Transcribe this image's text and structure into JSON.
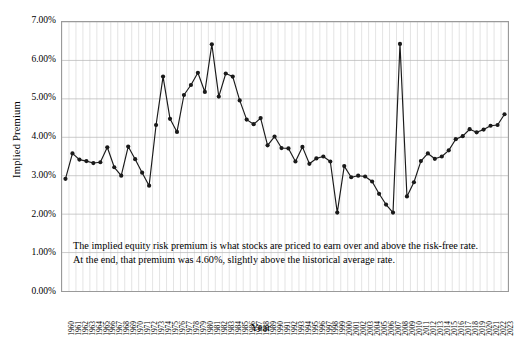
{
  "chart_data": {
    "type": "line",
    "title": "",
    "xlabel": "Year",
    "ylabel": "Implied Premium",
    "ylim": [
      0,
      7
    ],
    "ytick_labels": [
      "7.00%",
      "6.00%",
      "5.00%",
      "4.00%",
      "3.00%",
      "2.00%",
      "1.00%",
      "0.00%"
    ],
    "ytick_values": [
      7,
      6,
      5,
      4,
      3,
      2,
      1,
      0
    ],
    "grid": true,
    "legend": "none",
    "marker": "filled-circle",
    "line_color": "#1a1a1a",
    "grid_color": "#c8c8c8",
    "categories": [
      "1960",
      "1961",
      "1962",
      "1963",
      "1964",
      "1965",
      "1966",
      "1967",
      "1968",
      "1969",
      "1970",
      "1971",
      "1972",
      "1973",
      "1974",
      "1975",
      "1976",
      "1977",
      "1978",
      "1979",
      "1980",
      "1981",
      "1982",
      "1983",
      "1984",
      "1985",
      "1986",
      "1987",
      "1988",
      "1989",
      "1990",
      "1991",
      "1992",
      "1993",
      "1994",
      "1995",
      "1996",
      "1997",
      "1998",
      "1999",
      "2000",
      "2001",
      "2002",
      "2003",
      "2004",
      "2005",
      "2006",
      "2007",
      "2008",
      "2009",
      "2010",
      "2011",
      "2012",
      "2013",
      "2014",
      "2015",
      "2016",
      "2017",
      "2018",
      "2019",
      "2020",
      "2021",
      "2022",
      "2023"
    ],
    "values": [
      2.92,
      3.58,
      3.42,
      3.38,
      3.33,
      3.35,
      3.74,
      3.22,
      3.0,
      3.76,
      3.43,
      3.08,
      2.74,
      4.32,
      5.58,
      4.48,
      4.14,
      5.1,
      5.36,
      5.68,
      5.18,
      6.42,
      5.06,
      5.66,
      5.58,
      4.96,
      4.46,
      4.34,
      4.5,
      3.79,
      4.02,
      3.72,
      3.71,
      3.37,
      3.75,
      3.31,
      3.45,
      3.5,
      3.37,
      3.43,
      3.25,
      2.96,
      3.0,
      2.98,
      2.85,
      2.53,
      2.25,
      2.04,
      2.16,
      2.46,
      2.83,
      3.38,
      3.58,
      3.44,
      3.5,
      3.66,
      3.95,
      4.03,
      4.21,
      4.13,
      4.2,
      4.3,
      4.32,
      4.6
    ],
    "data_overrides": {
      "1960": 2.92,
      "1973": 4.32,
      "1974": 5.58,
      "1975": 4.48,
      "1981": 6.42,
      "1999": 2.04,
      "2008": 6.43,
      "2023": 4.6
    }
  },
  "annotation": {
    "line1": "The implied equity risk premium is what stocks are priced to earn over and above the risk-free rate.",
    "line2": "At the end, that premium was 4.60%, slightly above the historical average rate."
  }
}
